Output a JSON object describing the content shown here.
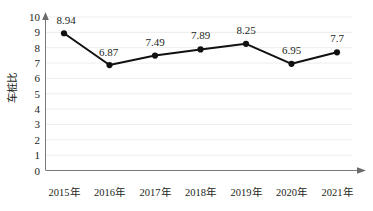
{
  "chart_data": {
    "type": "line",
    "title": "",
    "subtitle": "",
    "xlabel": "",
    "ylabel": "车桩比",
    "categories": [
      "2015年",
      "2016年",
      "2017年",
      "2018年",
      "2019年",
      "2020年",
      "2021年"
    ],
    "values": [
      8.94,
      6.87,
      7.49,
      7.89,
      8.25,
      6.95,
      7.7
    ],
    "data_labels": [
      "8.94",
      "6.87",
      "7.49",
      "7.89",
      "8.25",
      "6.95",
      "7.7"
    ],
    "series": [
      {
        "name": "车桩比",
        "values": [
          8.94,
          6.87,
          7.49,
          7.89,
          8.25,
          6.95,
          7.7
        ]
      }
    ],
    "ylim": [
      0,
      10
    ],
    "ytick_step": 1,
    "ytick_labels": [
      "0",
      "1",
      "2",
      "3",
      "4",
      "5",
      "6",
      "7",
      "8",
      "9",
      "10"
    ],
    "grid": "horizontal",
    "legend": "none",
    "marker": "circle",
    "marker_color": "#111111",
    "line_color": "#111111",
    "gridline_color": "#e9e9e9",
    "axis_color": "#6b6b6b",
    "background_color": "#ffffff",
    "text_color": "#231f20",
    "axis_arrows": true
  }
}
